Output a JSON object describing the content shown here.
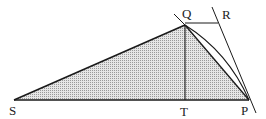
{
  "diagram": {
    "labels": {
      "S": "S",
      "Q": "Q",
      "R": "R",
      "T": "T",
      "P": "P"
    },
    "points": {
      "S": [
        14,
        100
      ],
      "Q": [
        185,
        25
      ],
      "T": [
        185,
        100
      ],
      "P": [
        249,
        100
      ],
      "R": [
        218,
        23
      ]
    },
    "colors": {
      "stroke": "#1a1a1a",
      "fill_shade": "#b8b8b8",
      "background": "#ffffff"
    }
  }
}
